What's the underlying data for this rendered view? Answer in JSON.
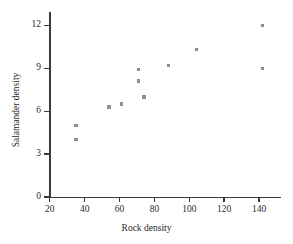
{
  "chart_data": {
    "type": "scatter",
    "title": "",
    "xlabel": "Rock density",
    "ylabel": "Salamander density",
    "xlim": [
      20,
      148
    ],
    "ylim": [
      0,
      12.9
    ],
    "grid": false,
    "legend": null,
    "marker": "filled-square-gray",
    "marker_color": "#9a9a9a",
    "axis_color": "#3a3a3a",
    "xticks": [
      20,
      40,
      60,
      80,
      100,
      120,
      140
    ],
    "xtick_labels": [
      "20",
      "40",
      "60",
      "80",
      "100",
      "120",
      "140"
    ],
    "yticks": [
      0,
      3,
      6,
      9,
      12
    ],
    "ytick_labels": [
      "0",
      "3",
      "6",
      "9",
      "12"
    ],
    "points": [
      {
        "x": 35,
        "y": 4.0
      },
      {
        "x": 35,
        "y": 5.0
      },
      {
        "x": 54,
        "y": 6.3
      },
      {
        "x": 61,
        "y": 6.5
      },
      {
        "x": 71,
        "y": 8.1
      },
      {
        "x": 71,
        "y": 8.9
      },
      {
        "x": 74,
        "y": 7.0
      },
      {
        "x": 88,
        "y": 9.2
      },
      {
        "x": 104,
        "y": 10.3
      },
      {
        "x": 142,
        "y": 12.0
      },
      {
        "x": 142,
        "y": 9.0
      }
    ]
  }
}
